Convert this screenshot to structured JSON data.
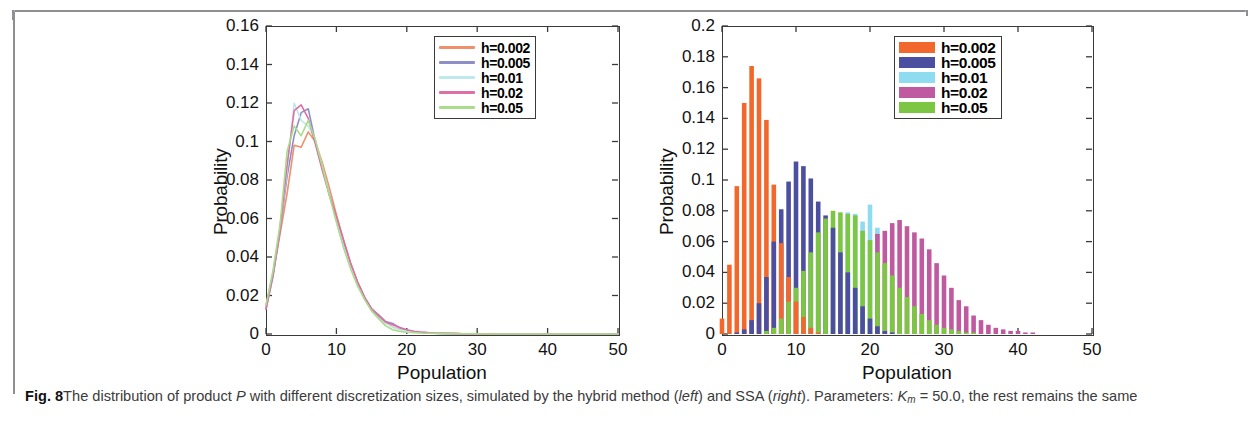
{
  "figure": {
    "label": "Fig. 8",
    "caption_part1": "The distribution of product ",
    "caption_italic1": "P",
    "caption_part2": " with different discretization sizes, simulated by the hybrid method (",
    "caption_italic2": "left",
    "caption_part3": ") and SSA (",
    "caption_italic3": "right",
    "caption_part4": "). Parameters: ",
    "caption_km": "K",
    "caption_km_sub": "m",
    "caption_part5": " = 50.0, the rest remains the same"
  },
  "colors": {
    "h0002_line": "#f0906a",
    "h0005_line": "#8d90c8",
    "h001_line": "#bfe7ee",
    "h002_line": "#dd6fa5",
    "h005_line": "#a9dd8a",
    "h0002_bar": "#f2682c",
    "h0005_bar": "#4c4fa0",
    "h001_bar": "#8fdcf0",
    "h002_bar": "#c05aa0",
    "h005_bar": "#7dc644",
    "axis": "#3a3a3a",
    "rule": "#8d8f92"
  },
  "chart_data": [
    {
      "id": "hybrid-method",
      "type": "line",
      "title": "",
      "xlabel": "Population",
      "ylabel": "Probability",
      "xlim": [
        0,
        50
      ],
      "ylim": [
        0,
        0.16
      ],
      "xticks": [
        0,
        10,
        20,
        30,
        40,
        50
      ],
      "xtick_labels": [
        "0",
        "10",
        "20",
        "30",
        "40",
        "50"
      ],
      "yticks": [
        0,
        0.02,
        0.04,
        0.06,
        0.08,
        0.1,
        0.12,
        0.14,
        0.16
      ],
      "ytick_labels": [
        "0",
        "0.02",
        "0.04",
        "0.06",
        "0.08",
        "0.1",
        "0.12",
        "0.14",
        "0.16"
      ],
      "grid": false,
      "legend_position": "top-right",
      "x": [
        0,
        1,
        2,
        3,
        4,
        5,
        6,
        7,
        8,
        9,
        10,
        11,
        12,
        13,
        14,
        15,
        16,
        17,
        18,
        19,
        20,
        21,
        22,
        23,
        24,
        25,
        26,
        27,
        28,
        29,
        30,
        32,
        34,
        36,
        38,
        40,
        42,
        44,
        46,
        48,
        50
      ],
      "series": [
        {
          "name": "h=0.002",
          "color": "#f0906a",
          "values": [
            0.015,
            0.031,
            0.052,
            0.073,
            0.098,
            0.097,
            0.105,
            0.1,
            0.089,
            0.076,
            0.062,
            0.049,
            0.037,
            0.027,
            0.019,
            0.013,
            0.009,
            0.006,
            0.0037,
            0.0024,
            0.0016,
            0.0011,
            0.0008,
            0.0006,
            0.0004,
            0.0003,
            0.0002,
            0.0002,
            0.0001,
            0.0001,
            0.0001,
            0,
            0,
            0,
            0,
            0,
            0,
            0,
            0,
            0,
            0
          ]
        },
        {
          "name": "h=0.005",
          "color": "#8d90c8",
          "values": [
            0.013,
            0.03,
            0.054,
            0.082,
            0.103,
            0.115,
            0.117,
            0.1,
            0.086,
            0.073,
            0.06,
            0.047,
            0.036,
            0.027,
            0.019,
            0.013,
            0.01,
            0.0065,
            0.0055,
            0.0032,
            0.0019,
            0.0013,
            0.0009,
            0.0006,
            0.0004,
            0.0003,
            0.0002,
            0.0002,
            0.0001,
            0.0001,
            0.0001,
            0,
            0,
            0,
            0,
            0,
            0,
            0,
            0,
            0,
            0
          ]
        },
        {
          "name": "h=0.01",
          "color": "#bfe7ee",
          "values": [
            0.014,
            0.032,
            0.056,
            0.085,
            0.12,
            0.111,
            0.108,
            0.101,
            0.087,
            0.073,
            0.059,
            0.046,
            0.035,
            0.026,
            0.018,
            0.012,
            0.0085,
            0.0055,
            0.0035,
            0.0022,
            0.0015,
            0.001,
            0.0007,
            0.0005,
            0.0004,
            0.0003,
            0.0002,
            0.0001,
            0.0001,
            0.0001,
            0.0001,
            0,
            0,
            0,
            0,
            0,
            0,
            0,
            0,
            0,
            0
          ]
        },
        {
          "name": "h=0.02",
          "color": "#dd6fa5",
          "values": [
            0.013,
            0.031,
            0.055,
            0.088,
            0.116,
            0.119,
            0.112,
            0.099,
            0.085,
            0.072,
            0.061,
            0.049,
            0.037,
            0.027,
            0.019,
            0.013,
            0.0095,
            0.0062,
            0.0048,
            0.0034,
            0.0022,
            0.0014,
            0.001,
            0.0007,
            0.0005,
            0.0004,
            0.0003,
            0.0002,
            0.0001,
            0.0001,
            0.0001,
            0,
            0,
            0,
            0,
            0,
            0,
            0,
            0,
            0,
            0
          ]
        },
        {
          "name": "h=0.05",
          "color": "#a9dd8a",
          "values": [
            0.015,
            0.033,
            0.057,
            0.095,
            0.108,
            0.103,
            0.111,
            0.101,
            0.087,
            0.072,
            0.058,
            0.045,
            0.034,
            0.025,
            0.018,
            0.012,
            0.008,
            0.0042,
            0.0022,
            0.0013,
            0.0009,
            0.0007,
            0.0005,
            0.0004,
            0.0003,
            0.0002,
            0.0002,
            0.0001,
            0.0001,
            0.0001,
            0.0001,
            0,
            0,
            0,
            0,
            0,
            0,
            0,
            0,
            0,
            0
          ]
        }
      ],
      "legend": [
        "h=0.002",
        "h=0.005",
        "h=0.01",
        "h=0.02",
        "h=0.05"
      ]
    },
    {
      "id": "ssa",
      "type": "bar",
      "title": "",
      "xlabel": "Population",
      "ylabel": "Probability",
      "xlim": [
        0,
        50
      ],
      "ylim": [
        0,
        0.2
      ],
      "xticks": [
        0,
        10,
        20,
        30,
        40,
        50
      ],
      "xtick_labels": [
        "0",
        "10",
        "20",
        "30",
        "40",
        "50"
      ],
      "yticks": [
        0,
        0.02,
        0.04,
        0.06,
        0.08,
        0.1,
        0.12,
        0.14,
        0.16,
        0.18,
        0.2
      ],
      "ytick_labels": [
        "0",
        "0.02",
        "0.04",
        "0.06",
        "0.08",
        "0.1",
        "0.12",
        "0.14",
        "0.16",
        "0.18",
        "0.2"
      ],
      "grid": false,
      "legend_position": "top-right",
      "categories": [
        0,
        1,
        2,
        3,
        4,
        5,
        6,
        7,
        8,
        9,
        10,
        11,
        12,
        13,
        14,
        15,
        16,
        17,
        18,
        19,
        20,
        21,
        22,
        23,
        24,
        25,
        26,
        27,
        28,
        29,
        30,
        31,
        32,
        33,
        34,
        35,
        36,
        37,
        38,
        39,
        40,
        41,
        42,
        43,
        44,
        45
      ],
      "series": [
        {
          "name": "h=0.002",
          "color": "#f2682c",
          "values": [
            0.01,
            0.045,
            0.096,
            0.15,
            0.174,
            0.166,
            0.139,
            0.097,
            0.059,
            0.037,
            0.021,
            0.011,
            0.004,
            0.001,
            0,
            0,
            0,
            0,
            0,
            0,
            0,
            0,
            0,
            0,
            0,
            0,
            0,
            0,
            0,
            0,
            0,
            0,
            0,
            0,
            0,
            0,
            0,
            0,
            0,
            0,
            0,
            0,
            0,
            0,
            0,
            0
          ]
        },
        {
          "name": "h=0.005",
          "color": "#4c4fa0",
          "values": [
            0,
            0,
            0.001,
            0.003,
            0.009,
            0.02,
            0.037,
            0.06,
            0.081,
            0.099,
            0.112,
            0.109,
            0.101,
            0.086,
            0.077,
            0.069,
            0.053,
            0.04,
            0.03,
            0.018,
            0.01,
            0.005,
            0.002,
            0.001,
            0,
            0,
            0,
            0,
            0,
            0,
            0,
            0,
            0,
            0,
            0,
            0,
            0,
            0,
            0,
            0,
            0,
            0,
            0,
            0,
            0,
            0
          ]
        },
        {
          "name": "h=0.01",
          "color": "#8fdcf0",
          "values": [
            0,
            0,
            0,
            0,
            0,
            0,
            0,
            0,
            0,
            0,
            0,
            0,
            0,
            0,
            0,
            0,
            0,
            0.079,
            0.078,
            0.073,
            0.084,
            0.069,
            0,
            0,
            0,
            0,
            0,
            0,
            0,
            0,
            0,
            0,
            0,
            0,
            0,
            0,
            0,
            0,
            0,
            0,
            0,
            0,
            0,
            0,
            0,
            0
          ]
        },
        {
          "name": "h=0.02",
          "color": "#c05aa0",
          "values": [
            0,
            0,
            0,
            0,
            0,
            0,
            0,
            0,
            0,
            0,
            0,
            0,
            0,
            0,
            0,
            0,
            0,
            0,
            0,
            0,
            0,
            0.065,
            0.067,
            0.072,
            0.074,
            0.07,
            0.066,
            0.062,
            0.055,
            0.046,
            0.038,
            0.03,
            0.022,
            0.018,
            0.012,
            0.009,
            0.006,
            0.004,
            0.003,
            0.002,
            0.002,
            0.001,
            0.001,
            0,
            0,
            0
          ]
        },
        {
          "name": "h=0.05",
          "color": "#7dc644",
          "values": [
            0,
            0,
            0,
            0,
            0,
            0,
            0.002,
            0.004,
            0.01,
            0.021,
            0.03,
            0.041,
            0.053,
            0.066,
            0.075,
            0.08,
            0.079,
            0.078,
            0.077,
            0.067,
            0.061,
            0.053,
            0.046,
            0.038,
            0.03,
            0.024,
            0.018,
            0.013,
            0.009,
            0.006,
            0.004,
            0.003,
            0.002,
            0.001,
            0.001,
            0,
            0,
            0,
            0,
            0,
            0,
            0,
            0,
            0,
            0,
            0
          ]
        }
      ],
      "legend": [
        "h=0.002",
        "h=0.005",
        "h=0.01",
        "h=0.02",
        "h=0.05"
      ]
    }
  ]
}
